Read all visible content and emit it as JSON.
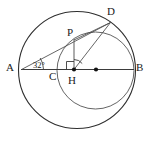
{
  "figure": {
    "type": "geometry-diagram",
    "width": 152,
    "height": 144,
    "background_color": "#ffffff",
    "stroke_color": "#3a3a3a",
    "dark_stroke_color": "#1a1a1a",
    "label_color": "#1a1a1a"
  },
  "labels": {
    "A": "A",
    "B": "B",
    "C": "C",
    "D": "D",
    "P": "P",
    "H": "H",
    "angle_CAD": "32°"
  },
  "points": {
    "A": {
      "x": 22,
      "y": 69.5,
      "label_x": 6,
      "label_y": 63
    },
    "B": {
      "x": 133,
      "y": 69.5,
      "label_x": 136,
      "label_y": 63
    },
    "C": {
      "x": 57,
      "y": 69.5,
      "label_x": 50,
      "label_y": 72
    },
    "D": {
      "x": 110,
      "y": 22.5,
      "label_x": 110,
      "label_y": 8
    },
    "P": {
      "x": 74,
      "y": 40,
      "label_x": 68,
      "label_y": 28
    },
    "H": {
      "x": 74,
      "y": 69.5,
      "label_x": 69,
      "label_y": 76
    },
    "O_small": {
      "x": 96,
      "y": 69.5
    }
  },
  "circles": [
    {
      "name": "outer-circle",
      "cx": 77,
      "cy": 70,
      "r": 58.5
    },
    {
      "name": "inner-circle",
      "cx": 95.5,
      "cy": 70.5,
      "r": 38.5
    }
  ],
  "segments": [
    {
      "name": "segment-AB",
      "from": "A",
      "to": "B"
    },
    {
      "name": "segment-AD",
      "from": "A",
      "to": "D"
    },
    {
      "name": "segment-PH",
      "from": "P",
      "to": "H"
    },
    {
      "name": "segment-HD",
      "from": "H",
      "to": "D"
    },
    {
      "name": "segment-PD",
      "from": "P",
      "to": "D"
    }
  ],
  "markers": {
    "right_angle_at_H": true,
    "angle_arc_at_H": true,
    "angle_arc_at_A": true,
    "dots": [
      "H",
      "O_small"
    ]
  }
}
